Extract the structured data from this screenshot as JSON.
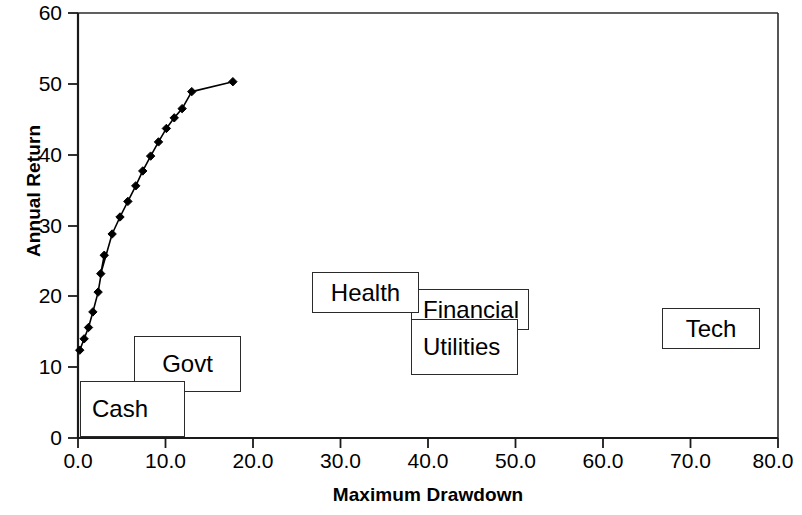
{
  "chart_data": {
    "type": "line",
    "title": "",
    "xlabel": "Maximum Drawdown",
    "ylabel": "Annual Return",
    "xlim": [
      0,
      80
    ],
    "ylim": [
      0,
      60
    ],
    "xticks": [
      "0.0",
      "10.0",
      "20.0",
      "30.0",
      "40.0",
      "50.0",
      "60.0",
      "70.0",
      "80.0"
    ],
    "yticks": [
      "0",
      "10",
      "20",
      "30",
      "40",
      "50",
      "60"
    ],
    "grid": false,
    "legend_position": "none",
    "series": [
      {
        "name": "Efficient frontier",
        "marker": "diamond",
        "color": "#000000",
        "points": [
          [
            0.2,
            12.4
          ],
          [
            0.7,
            14.0
          ],
          [
            1.2,
            15.6
          ],
          [
            1.7,
            17.8
          ],
          [
            2.3,
            20.6
          ],
          [
            3.0,
            25.8
          ],
          [
            2.6,
            23.2
          ],
          [
            3.9,
            28.8
          ],
          [
            4.8,
            31.2
          ],
          [
            5.7,
            33.4
          ],
          [
            6.6,
            35.6
          ],
          [
            7.4,
            37.7
          ],
          [
            8.3,
            39.8
          ],
          [
            9.2,
            41.8
          ],
          [
            10.1,
            43.7
          ],
          [
            11.0,
            45.2
          ],
          [
            11.9,
            46.5
          ],
          [
            13.0,
            48.9
          ],
          [
            17.7,
            50.3
          ]
        ]
      }
    ],
    "annotations": [
      {
        "label": "Cash",
        "x_range": [
          0.2,
          12.2
        ],
        "y_range": [
          0.4,
          9.9
        ]
      },
      {
        "label": "Govt",
        "x_range": [
          6.4,
          18.6
        ],
        "y_range": [
          8.1,
          17.6
        ]
      },
      {
        "label": "Health",
        "x_range": [
          26.7,
          38.8
        ],
        "y_range": [
          17.6,
          27.1
        ]
      },
      {
        "label": "Financial",
        "x_range": [
          38.0,
          51.4
        ],
        "y_range": [
          13.7,
          23.2
        ]
      },
      {
        "label": "Utilities",
        "x_range": [
          38.0,
          50.1
        ],
        "y_range": [
          9.4,
          18.9
        ]
      },
      {
        "label": "Tech",
        "x_range": [
          66.7,
          77.9
        ],
        "y_range": [
          12.7,
          22.2
        ]
      }
    ]
  },
  "boxes": {
    "cash": "Cash",
    "govt": "Govt",
    "health": "Health",
    "financial": "Financial",
    "utilities": "Utilities",
    "tech": "Tech"
  }
}
